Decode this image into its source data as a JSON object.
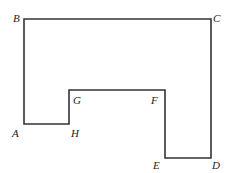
{
  "diagram": {
    "type": "polygon",
    "stroke": "#333333",
    "vertices": [
      {
        "label": "A",
        "x": 24,
        "y": 124,
        "lx": 12,
        "ly": 137
      },
      {
        "label": "B",
        "x": 24,
        "y": 19,
        "lx": 13,
        "ly": 22
      },
      {
        "label": "C",
        "x": 211,
        "y": 19,
        "lx": 213,
        "ly": 22
      },
      {
        "label": "D",
        "x": 211,
        "y": 158,
        "lx": 212,
        "ly": 169
      },
      {
        "label": "E",
        "x": 165,
        "y": 158,
        "lx": 153,
        "ly": 169
      },
      {
        "label": "F",
        "x": 165,
        "y": 90,
        "lx": 151,
        "ly": 104
      },
      {
        "label": "G",
        "x": 69,
        "y": 90,
        "lx": 73,
        "ly": 104
      },
      {
        "label": "H",
        "x": 69,
        "y": 124,
        "lx": 71,
        "ly": 137
      }
    ]
  }
}
